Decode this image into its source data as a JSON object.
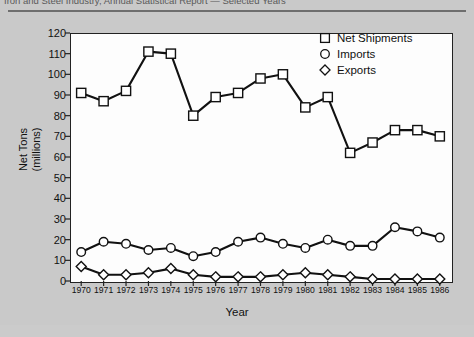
{
  "caption": {
    "top_line": "Iron and Steel Industry, Annual Statistical Report — Selected Years"
  },
  "legend": {
    "position": "top-right",
    "items": [
      {
        "label": "Net Shipments",
        "marker": "square-marker-icon"
      },
      {
        "label": "Imports",
        "marker": "circle-marker-icon"
      },
      {
        "label": "Exports",
        "marker": "diamond-marker-icon"
      }
    ]
  },
  "axes": {
    "y_title_line1": "Net Tons",
    "y_title_line2": "(millions)",
    "x_title": "Year"
  },
  "chart_data": {
    "type": "line",
    "title": "",
    "xlabel": "Year",
    "ylabel": "Net Tons (millions)",
    "ylim": [
      0,
      120
    ],
    "yticks": [
      0,
      10,
      20,
      30,
      40,
      50,
      60,
      70,
      80,
      90,
      100,
      110,
      120
    ],
    "grid": false,
    "legend_position": "top-right",
    "categories": [
      "1970",
      "1971",
      "1972",
      "1973",
      "1974",
      "1975",
      "1976",
      "1977",
      "1978",
      "1979",
      "1980",
      "1981",
      "1982",
      "1983",
      "1984",
      "1985",
      "1986"
    ],
    "series": [
      {
        "name": "Net Shipments",
        "marker": "square",
        "values": [
          91,
          87,
          92,
          111,
          110,
          80,
          89,
          91,
          98,
          100,
          84,
          89,
          62,
          67,
          73,
          73,
          70
        ]
      },
      {
        "name": "Imports",
        "marker": "circle",
        "values": [
          14,
          19,
          18,
          15,
          16,
          12,
          14,
          19,
          21,
          18,
          16,
          20,
          17,
          17,
          26,
          24,
          21
        ]
      },
      {
        "name": "Exports",
        "marker": "diamond",
        "values": [
          7,
          3,
          3,
          4,
          6,
          3,
          2,
          2,
          2,
          3,
          4,
          3,
          2,
          1,
          1,
          1,
          1
        ]
      }
    ]
  },
  "colors": {
    "page_background": "#c9c9c9",
    "plot_background": "#fdfdfd",
    "line": "#111111",
    "marker_fill": "#ffffff",
    "axis": "#222222"
  }
}
